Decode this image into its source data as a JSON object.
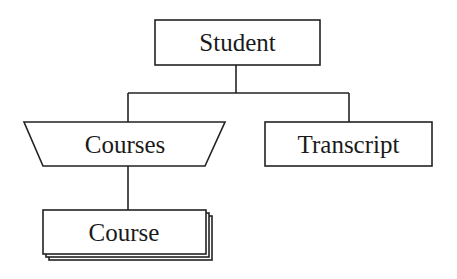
{
  "diagram": {
    "type": "hierarchy",
    "colors": {
      "stroke": "#222222",
      "fill": "#ffffff",
      "text": "#1a1a1a"
    },
    "nodes": [
      {
        "id": "student",
        "label": "Student",
        "shape": "rectangle"
      },
      {
        "id": "courses",
        "label": "Courses",
        "shape": "inverted-trapezoid"
      },
      {
        "id": "transcript",
        "label": "Transcript",
        "shape": "rectangle"
      },
      {
        "id": "course",
        "label": "Course",
        "shape": "stacked-rectangle"
      }
    ],
    "edges": [
      {
        "from": "student",
        "to": "courses"
      },
      {
        "from": "student",
        "to": "transcript"
      },
      {
        "from": "courses",
        "to": "course"
      }
    ]
  }
}
